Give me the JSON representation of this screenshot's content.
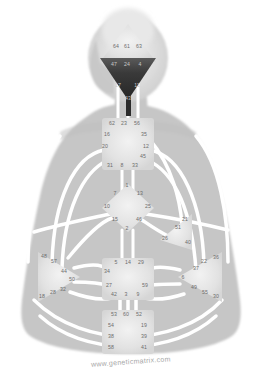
{
  "diagram": {
    "watermark": "www.geneticmatrix.com",
    "colors": {
      "background": "#ffffff",
      "body_silhouette": "#c6c6c6",
      "channel": "#ffffff",
      "center_fill": "#e4e4e4",
      "center_defined_dark": "#2f2f2f",
      "gate_text": "#6d6d6d",
      "gate_text_on_dark": "#c9c9c9",
      "watermark_text": "#a7a7a7"
    },
    "centers": [
      {
        "id": "head",
        "name": "Head Center",
        "shape": "triangle-up",
        "state": "undefined",
        "gates": [
          {
            "num": "64",
            "x": 116,
            "y": 47
          },
          {
            "num": "61",
            "x": 127,
            "y": 47
          },
          {
            "num": "63",
            "x": 139,
            "y": 47
          }
        ]
      },
      {
        "id": "ajna",
        "name": "Ajna Center",
        "shape": "triangle-down",
        "state": "defined",
        "gates": [
          {
            "num": "47",
            "x": 114,
            "y": 65
          },
          {
            "num": "24",
            "x": 127,
            "y": 65
          },
          {
            "num": "4",
            "x": 140,
            "y": 65
          },
          {
            "num": "17",
            "x": 118,
            "y": 86
          },
          {
            "num": "11",
            "x": 137,
            "y": 86
          },
          {
            "num": "43",
            "x": 128,
            "y": 99
          }
        ]
      },
      {
        "id": "throat",
        "name": "Throat Center",
        "shape": "square",
        "state": "undefined",
        "gates": [
          {
            "num": "62",
            "x": 112,
            "y": 124
          },
          {
            "num": "23",
            "x": 124,
            "y": 124
          },
          {
            "num": "56",
            "x": 137,
            "y": 124
          },
          {
            "num": "16",
            "x": 107,
            "y": 135
          },
          {
            "num": "35",
            "x": 144,
            "y": 135
          },
          {
            "num": "20",
            "x": 105,
            "y": 147
          },
          {
            "num": "12",
            "x": 146,
            "y": 147
          },
          {
            "num": "45",
            "x": 143,
            "y": 157
          },
          {
            "num": "31",
            "x": 110,
            "y": 166
          },
          {
            "num": "8",
            "x": 122,
            "y": 166
          },
          {
            "num": "33",
            "x": 135,
            "y": 166
          }
        ]
      },
      {
        "id": "g",
        "name": "G Center",
        "shape": "diamond",
        "state": "undefined",
        "gates": [
          {
            "num": "1",
            "x": 127,
            "y": 186
          },
          {
            "num": "7",
            "x": 115,
            "y": 194
          },
          {
            "num": "13",
            "x": 140,
            "y": 194
          },
          {
            "num": "10",
            "x": 107,
            "y": 207
          },
          {
            "num": "25",
            "x": 148,
            "y": 207
          },
          {
            "num": "15",
            "x": 115,
            "y": 220
          },
          {
            "num": "46",
            "x": 139,
            "y": 220
          },
          {
            "num": "2",
            "x": 127,
            "y": 229
          }
        ]
      },
      {
        "id": "heart",
        "name": "Heart / Ego Center",
        "shape": "triangle-left",
        "state": "undefined",
        "gates": [
          {
            "num": "21",
            "x": 185,
            "y": 220
          },
          {
            "num": "51",
            "x": 178,
            "y": 228
          },
          {
            "num": "26",
            "x": 165,
            "y": 239
          },
          {
            "num": "40",
            "x": 188,
            "y": 243
          }
        ]
      },
      {
        "id": "spleen",
        "name": "Spleen Center",
        "shape": "triangle-right",
        "state": "undefined",
        "gates": [
          {
            "num": "48",
            "x": 44,
            "y": 257
          },
          {
            "num": "57",
            "x": 54,
            "y": 262
          },
          {
            "num": "44",
            "x": 64,
            "y": 272
          },
          {
            "num": "50",
            "x": 72,
            "y": 280
          },
          {
            "num": "32",
            "x": 63,
            "y": 290
          },
          {
            "num": "28",
            "x": 53,
            "y": 293
          },
          {
            "num": "18",
            "x": 42,
            "y": 297
          }
        ]
      },
      {
        "id": "solar_plexus",
        "name": "Solar Plexus Center",
        "shape": "triangle-left",
        "state": "undefined",
        "gates": [
          {
            "num": "22",
            "x": 204,
            "y": 262
          },
          {
            "num": "36",
            "x": 216,
            "y": 258
          },
          {
            "num": "37",
            "x": 196,
            "y": 269
          },
          {
            "num": "6",
            "x": 183,
            "y": 278
          },
          {
            "num": "49",
            "x": 194,
            "y": 288
          },
          {
            "num": "55",
            "x": 205,
            "y": 293
          },
          {
            "num": "30",
            "x": 216,
            "y": 297
          }
        ]
      },
      {
        "id": "sacral",
        "name": "Sacral Center",
        "shape": "square",
        "state": "undefined",
        "gates": [
          {
            "num": "5",
            "x": 116,
            "y": 263
          },
          {
            "num": "14",
            "x": 128,
            "y": 263
          },
          {
            "num": "29",
            "x": 141,
            "y": 263
          },
          {
            "num": "34",
            "x": 107,
            "y": 272
          },
          {
            "num": "27",
            "x": 109,
            "y": 286
          },
          {
            "num": "59",
            "x": 145,
            "y": 286
          },
          {
            "num": "42",
            "x": 114,
            "y": 295
          },
          {
            "num": "3",
            "x": 126,
            "y": 295
          },
          {
            "num": "9",
            "x": 138,
            "y": 295
          }
        ]
      },
      {
        "id": "root",
        "name": "Root Center",
        "shape": "square",
        "state": "undefined",
        "gates": [
          {
            "num": "53",
            "x": 114,
            "y": 315
          },
          {
            "num": "60",
            "x": 126,
            "y": 315
          },
          {
            "num": "52",
            "x": 139,
            "y": 315
          },
          {
            "num": "54",
            "x": 111,
            "y": 326
          },
          {
            "num": "19",
            "x": 144,
            "y": 326
          },
          {
            "num": "38",
            "x": 111,
            "y": 337
          },
          {
            "num": "39",
            "x": 144,
            "y": 337
          },
          {
            "num": "58",
            "x": 111,
            "y": 348
          },
          {
            "num": "41",
            "x": 144,
            "y": 348
          }
        ]
      }
    ]
  }
}
